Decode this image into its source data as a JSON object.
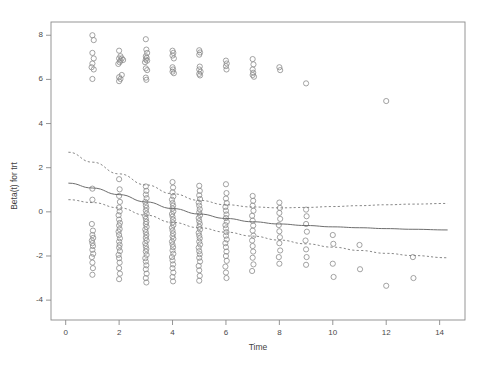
{
  "chart_data": {
    "type": "scatter",
    "title": "",
    "xlabel": "Time",
    "ylabel": "Beta(t) for trt",
    "xlim": [
      -0.55,
      14.95
    ],
    "ylim": [
      -4.9,
      8.6
    ],
    "xticks": [
      0,
      2,
      4,
      6,
      8,
      10,
      12,
      14
    ],
    "yticks": [
      8,
      6,
      4,
      2,
      0,
      -2,
      -4
    ],
    "xtick_labels": [
      "0",
      "2",
      "4",
      "6",
      "8",
      "10",
      "12",
      "14"
    ],
    "ytick_labels": [
      "8",
      "6",
      "4",
      "2",
      "0",
      "-2",
      "-4"
    ],
    "grid": false,
    "legend": false,
    "marker": {
      "shape": "open-circle",
      "radius_px": 2.6,
      "color": "#8c8c8c",
      "stroke_width": 0.8
    },
    "frame": {
      "box": true,
      "color": "#8a8a8a",
      "line_width": 0.9
    },
    "series": [
      {
        "name": "residuals-upper-cluster",
        "marker": "open-circle",
        "points": [
          [
            1.0,
            8.0
          ],
          [
            1.05,
            7.78
          ],
          [
            1.0,
            7.2
          ],
          [
            1.05,
            6.95
          ],
          [
            1.0,
            6.72
          ],
          [
            1.05,
            6.45
          ],
          [
            1.0,
            6.02
          ],
          [
            0.97,
            6.55
          ],
          [
            2.0,
            7.3
          ],
          [
            2.05,
            7.05
          ],
          [
            2.0,
            6.95
          ],
          [
            2.05,
            6.85
          ],
          [
            2.02,
            6.78
          ],
          [
            1.97,
            6.7
          ],
          [
            2.1,
            6.95
          ],
          [
            2.15,
            6.88
          ],
          [
            2.0,
            6.1
          ],
          [
            2.05,
            6.02
          ],
          [
            2.0,
            5.92
          ],
          [
            2.1,
            6.2
          ],
          [
            3.0,
            7.82
          ],
          [
            3.02,
            7.35
          ],
          [
            3.05,
            7.2
          ],
          [
            3.0,
            7.05
          ],
          [
            3.03,
            6.98
          ],
          [
            3.0,
            6.9
          ],
          [
            3.05,
            6.85
          ],
          [
            2.97,
            6.78
          ],
          [
            3.0,
            6.5
          ],
          [
            3.05,
            6.42
          ],
          [
            3.0,
            6.08
          ],
          [
            3.02,
            5.98
          ],
          [
            4.0,
            7.3
          ],
          [
            4.03,
            7.2
          ],
          [
            4.0,
            7.08
          ],
          [
            4.05,
            6.95
          ],
          [
            4.0,
            6.55
          ],
          [
            4.02,
            6.45
          ],
          [
            4.0,
            6.35
          ],
          [
            4.05,
            6.28
          ],
          [
            5.0,
            7.32
          ],
          [
            5.03,
            7.22
          ],
          [
            5.0,
            7.12
          ],
          [
            5.02,
            6.58
          ],
          [
            5.0,
            6.45
          ],
          [
            5.05,
            6.35
          ],
          [
            5.0,
            6.25
          ],
          [
            5.03,
            6.18
          ],
          [
            6.0,
            6.85
          ],
          [
            6.03,
            6.72
          ],
          [
            6.0,
            6.6
          ],
          [
            6.02,
            6.45
          ],
          [
            7.0,
            6.92
          ],
          [
            7.03,
            6.68
          ],
          [
            7.0,
            6.45
          ],
          [
            7.02,
            6.3
          ],
          [
            7.0,
            6.2
          ],
          [
            7.05,
            6.12
          ],
          [
            8.0,
            6.55
          ],
          [
            8.03,
            6.42
          ],
          [
            9.0,
            5.82
          ],
          [
            12.0,
            5.02
          ]
        ]
      },
      {
        "name": "residuals-lower-cluster",
        "marker": "open-circle",
        "points": [
          [
            1.0,
            1.05
          ],
          [
            1.0,
            0.55
          ],
          [
            0.98,
            -0.55
          ],
          [
            1.02,
            -0.85
          ],
          [
            1.0,
            -1.05
          ],
          [
            1.03,
            -1.18
          ],
          [
            0.98,
            -1.3
          ],
          [
            1.0,
            -1.42
          ],
          [
            1.02,
            -1.55
          ],
          [
            1.0,
            -1.72
          ],
          [
            1.03,
            -1.9
          ],
          [
            0.98,
            -2.05
          ],
          [
            1.0,
            -2.3
          ],
          [
            1.02,
            -2.55
          ],
          [
            1.0,
            -2.85
          ],
          [
            2.0,
            1.48
          ],
          [
            2.02,
            1.02
          ],
          [
            2.0,
            0.72
          ],
          [
            2.03,
            0.45
          ],
          [
            2.0,
            0.2
          ],
          [
            2.02,
            0.02
          ],
          [
            1.98,
            -0.15
          ],
          [
            2.0,
            -0.35
          ],
          [
            2.03,
            -0.5
          ],
          [
            2.0,
            -0.62
          ],
          [
            2.02,
            -0.78
          ],
          [
            1.98,
            -0.9
          ],
          [
            2.0,
            -1.05
          ],
          [
            2.03,
            -1.2
          ],
          [
            2.0,
            -1.35
          ],
          [
            2.02,
            -1.5
          ],
          [
            2.0,
            -1.62
          ],
          [
            2.03,
            -1.78
          ],
          [
            1.98,
            -1.95
          ],
          [
            2.0,
            -2.1
          ],
          [
            2.02,
            -2.3
          ],
          [
            2.0,
            -2.55
          ],
          [
            2.03,
            -2.8
          ],
          [
            2.0,
            -3.05
          ],
          [
            3.0,
            1.15
          ],
          [
            3.02,
            0.95
          ],
          [
            3.0,
            0.78
          ],
          [
            3.03,
            0.62
          ],
          [
            2.98,
            0.45
          ],
          [
            3.0,
            0.3
          ],
          [
            3.02,
            0.18
          ],
          [
            3.0,
            0.05
          ],
          [
            3.03,
            -0.08
          ],
          [
            2.98,
            -0.2
          ],
          [
            3.0,
            -0.32
          ],
          [
            3.02,
            -0.45
          ],
          [
            3.0,
            -0.55
          ],
          [
            3.03,
            -0.68
          ],
          [
            2.98,
            -0.8
          ],
          [
            3.0,
            -0.92
          ],
          [
            3.02,
            -1.05
          ],
          [
            3.0,
            -1.18
          ],
          [
            3.03,
            -1.3
          ],
          [
            2.98,
            -1.42
          ],
          [
            3.0,
            -1.55
          ],
          [
            3.02,
            -1.68
          ],
          [
            3.0,
            -1.8
          ],
          [
            3.03,
            -1.95
          ],
          [
            2.98,
            -2.1
          ],
          [
            3.0,
            -2.25
          ],
          [
            3.02,
            -2.42
          ],
          [
            3.0,
            -2.6
          ],
          [
            3.03,
            -2.8
          ],
          [
            3.0,
            -3.0
          ],
          [
            3.02,
            -3.2
          ],
          [
            4.0,
            1.35
          ],
          [
            4.02,
            1.1
          ],
          [
            4.0,
            0.88
          ],
          [
            4.03,
            0.7
          ],
          [
            3.98,
            0.55
          ],
          [
            4.0,
            0.4
          ],
          [
            4.02,
            0.28
          ],
          [
            4.0,
            0.15
          ],
          [
            4.03,
            0.02
          ],
          [
            3.98,
            -0.1
          ],
          [
            4.0,
            -0.22
          ],
          [
            4.02,
            -0.35
          ],
          [
            4.0,
            -0.48
          ],
          [
            4.03,
            -0.6
          ],
          [
            3.98,
            -0.72
          ],
          [
            4.0,
            -0.85
          ],
          [
            4.02,
            -0.98
          ],
          [
            4.0,
            -1.1
          ],
          [
            4.03,
            -1.22
          ],
          [
            3.98,
            -1.35
          ],
          [
            4.0,
            -1.48
          ],
          [
            4.02,
            -1.6
          ],
          [
            4.0,
            -1.75
          ],
          [
            4.03,
            -1.9
          ],
          [
            3.98,
            -2.05
          ],
          [
            4.0,
            -2.2
          ],
          [
            4.02,
            -2.38
          ],
          [
            4.0,
            -2.55
          ],
          [
            4.03,
            -2.75
          ],
          [
            4.0,
            -2.95
          ],
          [
            4.02,
            -3.15
          ],
          [
            5.0,
            1.18
          ],
          [
            5.02,
            0.95
          ],
          [
            5.0,
            0.75
          ],
          [
            5.03,
            0.58
          ],
          [
            4.98,
            0.42
          ],
          [
            5.0,
            0.28
          ],
          [
            5.02,
            0.12
          ],
          [
            5.0,
            -0.02
          ],
          [
            5.03,
            -0.15
          ],
          [
            4.98,
            -0.28
          ],
          [
            5.0,
            -0.42
          ],
          [
            5.02,
            -0.55
          ],
          [
            5.0,
            -0.68
          ],
          [
            5.03,
            -0.8
          ],
          [
            4.98,
            -0.95
          ],
          [
            5.0,
            -1.08
          ],
          [
            5.02,
            -1.2
          ],
          [
            5.0,
            -1.35
          ],
          [
            5.03,
            -1.48
          ],
          [
            4.98,
            -1.62
          ],
          [
            5.0,
            -1.78
          ],
          [
            5.02,
            -1.92
          ],
          [
            5.0,
            -2.08
          ],
          [
            5.03,
            -2.25
          ],
          [
            4.98,
            -2.45
          ],
          [
            5.0,
            -2.65
          ],
          [
            5.02,
            -2.9
          ],
          [
            5.0,
            -3.12
          ],
          [
            6.0,
            1.25
          ],
          [
            6.02,
            0.85
          ],
          [
            6.0,
            0.6
          ],
          [
            6.03,
            0.4
          ],
          [
            5.98,
            0.22
          ],
          [
            6.0,
            0.05
          ],
          [
            6.02,
            -0.12
          ],
          [
            6.0,
            -0.28
          ],
          [
            6.03,
            -0.45
          ],
          [
            5.98,
            -0.6
          ],
          [
            6.0,
            -0.75
          ],
          [
            6.02,
            -0.92
          ],
          [
            6.0,
            -1.08
          ],
          [
            6.03,
            -1.25
          ],
          [
            5.98,
            -1.42
          ],
          [
            6.0,
            -1.6
          ],
          [
            6.02,
            -1.8
          ],
          [
            6.0,
            -2.0
          ],
          [
            6.03,
            -2.22
          ],
          [
            5.98,
            -2.48
          ],
          [
            6.0,
            -2.75
          ],
          [
            6.02,
            -3.0
          ],
          [
            7.0,
            0.72
          ],
          [
            7.02,
            0.5
          ],
          [
            7.0,
            0.28
          ],
          [
            7.03,
            0.05
          ],
          [
            6.98,
            -0.18
          ],
          [
            7.0,
            -0.4
          ],
          [
            7.02,
            -0.62
          ],
          [
            7.0,
            -0.85
          ],
          [
            7.03,
            -1.08
          ],
          [
            6.98,
            -1.3
          ],
          [
            7.0,
            -1.55
          ],
          [
            7.02,
            -1.8
          ],
          [
            7.0,
            -2.08
          ],
          [
            7.03,
            -2.38
          ],
          [
            6.98,
            -2.68
          ],
          [
            8.0,
            0.42
          ],
          [
            8.02,
            0.18
          ],
          [
            8.0,
            -0.05
          ],
          [
            8.03,
            -0.32
          ],
          [
            7.98,
            -0.6
          ],
          [
            8.0,
            -0.88
          ],
          [
            8.02,
            -1.15
          ],
          [
            8.0,
            -1.42
          ],
          [
            8.03,
            -1.75
          ],
          [
            7.98,
            -2.05
          ],
          [
            8.0,
            -2.35
          ],
          [
            9.0,
            0.1
          ],
          [
            9.02,
            -0.2
          ],
          [
            9.0,
            -0.55
          ],
          [
            9.03,
            -0.9
          ],
          [
            8.98,
            -1.3
          ],
          [
            9.0,
            -1.7
          ],
          [
            9.02,
            -2.05
          ],
          [
            9.0,
            -2.4
          ],
          [
            10.0,
            -1.05
          ],
          [
            10.02,
            -1.45
          ],
          [
            10.0,
            -2.35
          ],
          [
            10.03,
            -2.95
          ],
          [
            11.0,
            -1.5
          ],
          [
            11.02,
            -2.6
          ],
          [
            12.0,
            -3.35
          ],
          [
            13.0,
            -2.05
          ],
          [
            13.02,
            -3.0
          ]
        ]
      }
    ],
    "fits": [
      {
        "name": "smooth-fit",
        "style": "solid",
        "color": "#6e6e6e",
        "line_width": 1.0,
        "x": [
          0.1,
          1.0,
          2.0,
          3.0,
          4.0,
          5.0,
          6.0,
          7.0,
          8.0,
          9.0,
          10.0,
          11.0,
          12.0,
          13.0,
          14.3
        ],
        "y": [
          1.3,
          1.08,
          0.78,
          0.45,
          0.15,
          -0.1,
          -0.3,
          -0.45,
          -0.55,
          -0.62,
          -0.68,
          -0.72,
          -0.76,
          -0.79,
          -0.82
        ]
      },
      {
        "name": "upper-confidence-band",
        "style": "dashed",
        "color": "#7a7a7a",
        "line_width": 0.9,
        "x": [
          0.1,
          1.0,
          2.0,
          3.0,
          4.0,
          5.0,
          6.0,
          7.0,
          8.0,
          9.0,
          10.0,
          11.0,
          12.0,
          13.0,
          14.3
        ],
        "y": [
          2.7,
          2.25,
          1.72,
          1.22,
          0.82,
          0.52,
          0.32,
          0.22,
          0.18,
          0.2,
          0.24,
          0.28,
          0.32,
          0.35,
          0.38
        ]
      },
      {
        "name": "lower-confidence-band",
        "style": "dashed",
        "color": "#7a7a7a",
        "line_width": 0.9,
        "x": [
          0.1,
          1.0,
          2.0,
          3.0,
          4.0,
          5.0,
          6.0,
          7.0,
          8.0,
          9.0,
          10.0,
          11.0,
          12.0,
          13.0,
          14.3
        ],
        "y": [
          0.55,
          0.42,
          0.18,
          -0.15,
          -0.48,
          -0.72,
          -0.92,
          -1.1,
          -1.28,
          -1.45,
          -1.6,
          -1.75,
          -1.88,
          -1.98,
          -2.08
        ]
      }
    ]
  }
}
